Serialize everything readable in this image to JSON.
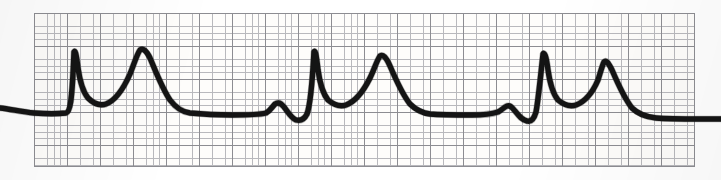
{
  "figure": {
    "kind": "ecg-rhythm-strip",
    "background_color": "#ffffff",
    "width_px": 721,
    "height_px": 180
  },
  "grid": {
    "name": "ecg-graph-paper",
    "left_px": 34,
    "top_px": 13,
    "width_px": 661,
    "height_px": 154,
    "small_square_px": 6.6,
    "large_square_px": 33,
    "small_squares_per_large": 5,
    "fine_line_color": "#b9b9bd",
    "bold_line_color": "#8d8d92",
    "paper_color": "#fefdfb",
    "border_color": "#8d8d92"
  },
  "trace": {
    "name": "ecg-waveform",
    "stroke_color": "#141414",
    "stroke_width_px": 5.4,
    "baseline_y_px": 114,
    "beat_count": 3,
    "r_peak_x_px": [
      75,
      315,
      535
    ],
    "r_peak_y_px": [
      52,
      52,
      52
    ],
    "t_peak_x_px": [
      139,
      378,
      598
    ],
    "t_peak_y_px": [
      50,
      56,
      62
    ],
    "p_wave_x_px": [
      275,
      495
    ],
    "p_wave_y_px": [
      104,
      106
    ],
    "rr_interval_px": 220,
    "path_d": "M 0,108 C 10,109 22,112 34,113 C 46,114 58,114 66,113 C 70,112 72,104 74,52 C 75,50 76,52 78,68 C 80,82 83,92 88,98 C 94,104 100,106 106,104 C 114,101 122,92 130,74 C 134,64 137,54 140,50 C 143,48 146,50 150,58 C 156,72 162,88 170,100 C 176,108 182,112 190,113 C 200,114 214,115 232,115 C 248,115 258,115 266,113 C 270,111 272,107 275,104 C 278,102 281,103 284,107 C 288,112 291,118 296,120 C 300,121 304,120 307,114 C 310,106 312,88 314,52 C 315,50 316,52 318,70 C 320,84 323,94 328,100 C 334,105 340,107 346,105 C 354,102 362,94 370,78 C 374,70 377,60 380,56 C 383,54 386,57 390,66 C 396,80 402,94 410,104 C 416,110 422,113 430,114 C 442,115 456,115 472,115 C 484,115 492,114 498,112 C 502,110 504,107 507,106 C 510,105 512,107 515,111 C 519,116 522,120 527,121 C 531,122 534,119 536,112 C 538,102 540,82 543,54 C 544,52 546,54 548,70 C 550,84 553,94 558,100 C 564,105 570,107 576,105 C 584,102 592,94 598,80 C 600,74 602,66 604,62 C 606,60 608,62 612,70 C 618,84 624,98 632,108 C 638,114 646,117 656,118 C 668,119 684,119 700,119 C 712,119 718,119 721,119"
  },
  "labels": {
    "alt_text": "Electrocardiogram rhythm strip showing three beats with tall peaked R waves, small P waves and broad rounded T waves on standard ECG graph paper"
  }
}
